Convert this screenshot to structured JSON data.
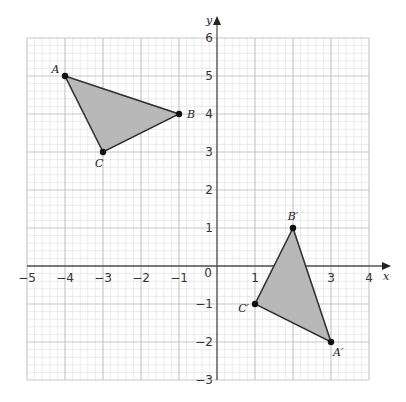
{
  "chart_data": {
    "type": "diagram",
    "title": "",
    "xlabel": "x",
    "ylabel": "y",
    "xlim": [
      -5,
      4
    ],
    "ylim": [
      -3,
      6
    ],
    "grid": true,
    "minor_grid_per_unit": 5,
    "x_ticks": [
      "-5",
      "-4",
      "-3",
      "-2",
      "-1",
      "0",
      "1",
      "2",
      "3",
      "4"
    ],
    "y_ticks": [
      "-3",
      "-2",
      "-1",
      "1",
      "2",
      "3",
      "4",
      "5",
      "6"
    ],
    "origin_label": "0",
    "shapes": [
      {
        "name": "triangle ABC",
        "fill": "#b8b8b8",
        "stroke": "#333333",
        "vertices": [
          {
            "label": "A",
            "x": -4,
            "y": 5
          },
          {
            "label": "B",
            "x": -1,
            "y": 4
          },
          {
            "label": "C",
            "x": -3,
            "y": 3
          }
        ]
      },
      {
        "name": "triangle A'B'C'",
        "fill": "#b8b8b8",
        "stroke": "#333333",
        "vertices": [
          {
            "label": "A′",
            "x": 3,
            "y": -2
          },
          {
            "label": "B′",
            "x": 2,
            "y": 1
          },
          {
            "label": "C′",
            "x": 1,
            "y": -1
          }
        ]
      }
    ]
  },
  "colors": {
    "minor_grid": "#e6e6e6",
    "major_grid": "#c8c8c8",
    "axis": "#555555",
    "shape_fill": "#b8b8b8",
    "shape_stroke": "#333333",
    "point": "#111111"
  }
}
